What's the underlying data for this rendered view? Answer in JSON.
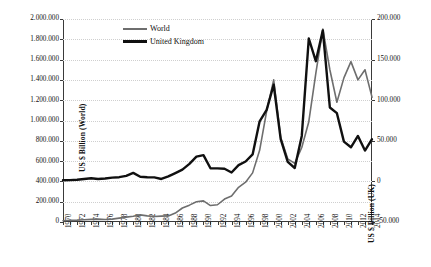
{
  "chart_data": {
    "type": "line",
    "title": "",
    "xlabel": "",
    "ylabel": "US $ Billion (World)",
    "ylabel_secondary": "US $ Billion (UK)",
    "legend_position": "top-left-inside",
    "grid": true,
    "ylim": [
      0,
      2000000
    ],
    "ylim_secondary": [
      -50000,
      200000
    ],
    "xlim": [
      1970,
      2014
    ],
    "yticks": [
      "0",
      "200.000",
      "400.000",
      "600.000",
      "800.000",
      "1.000.000",
      "1.200.000",
      "1.400.000",
      "1.600.000",
      "1.800.000",
      "2.000.000"
    ],
    "ytick_values": [
      0,
      200000,
      400000,
      600000,
      800000,
      1000000,
      1200000,
      1400000,
      1600000,
      1800000,
      2000000
    ],
    "yticks_secondary": [
      "-50.000",
      "0",
      "50.000",
      "100.000",
      "150.000",
      "200.000"
    ],
    "ytick_values_secondary": [
      -50000,
      0,
      50000,
      100000,
      150000,
      200000
    ],
    "x": [
      1970,
      1971,
      1972,
      1973,
      1974,
      1975,
      1976,
      1977,
      1978,
      1979,
      1980,
      1981,
      1982,
      1983,
      1984,
      1985,
      1986,
      1987,
      1988,
      1989,
      1990,
      1991,
      1992,
      1993,
      1994,
      1995,
      1996,
      1997,
      1998,
      1999,
      2000,
      2001,
      2002,
      2003,
      2004,
      2005,
      2006,
      2007,
      2008,
      2009,
      2010,
      2011,
      2012,
      2013,
      2014
    ],
    "xtick_labels": [
      "1970",
      "1972",
      "1974",
      "1976",
      "1978",
      "1980",
      "1982",
      "1984",
      "1986",
      "1988",
      "1990",
      "1992",
      "1994",
      "1996",
      "1998",
      "2000",
      "2002",
      "2004",
      "2006",
      "2008",
      "2010",
      "2012",
      "2014"
    ],
    "series": [
      {
        "name": "World",
        "axis": "left",
        "color": "#6e6e6e",
        "width": 1.6,
        "values": [
          13000,
          16000,
          18000,
          22000,
          26000,
          28000,
          24000,
          28000,
          38000,
          48000,
          56000,
          70000,
          60000,
          54000,
          58000,
          60000,
          88000,
          138000,
          166000,
          200000,
          208000,
          162000,
          170000,
          226000,
          256000,
          342000,
          392000,
          484000,
          706000,
          1092000,
          1400000,
          832000,
          622000,
          578000,
          734000,
          988000,
          1464000,
          1900000,
          1500000,
          1180000,
          1420000,
          1580000,
          1400000,
          1500000,
          1230000
        ]
      },
      {
        "name": "United Kingdom",
        "axis": "right",
        "color": "#101010",
        "width": 2.4,
        "values": [
          1400,
          1600,
          2100,
          3000,
          3800,
          3000,
          3600,
          4600,
          5200,
          6800,
          10500,
          5800,
          5200,
          5000,
          3000,
          6100,
          10200,
          14500,
          21500,
          30500,
          32400,
          16200,
          16100,
          15500,
          11000,
          20000,
          24500,
          33200,
          74000,
          88000,
          119000,
          52000,
          24000,
          16500,
          56000,
          176000,
          148000,
          186000,
          91000,
          84000,
          49000,
          42000,
          56000,
          38000,
          52000
        ]
      }
    ]
  },
  "legend": {
    "items": [
      {
        "label": "World",
        "key": "world"
      },
      {
        "label": "United Kingdom",
        "key": "united-kingdom"
      }
    ]
  }
}
